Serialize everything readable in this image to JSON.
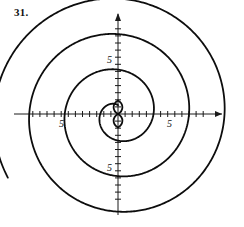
{
  "figure": {
    "problem_number": "31.",
    "background_color": "#ffffff",
    "ink_color": "#0d0d0d"
  },
  "axes": {
    "origin_px": [
      118,
      114
    ],
    "unit_px": 7.1,
    "x_label_left": "5",
    "x_label_right": "5",
    "y_label_top": "5",
    "y_label_bottom": "5",
    "x_tick_values": [
      -12,
      -11,
      -10,
      -9,
      -8,
      -7,
      -6,
      -5,
      -4,
      -3,
      -2,
      -1,
      1,
      2,
      3,
      4,
      5,
      6,
      7,
      8,
      9,
      10,
      11,
      12
    ],
    "y_tick_values": [
      -12,
      -11,
      -10,
      -9,
      -8,
      -7,
      -6,
      -5,
      -4,
      -3,
      -2,
      -1,
      1,
      2,
      3,
      4,
      5,
      6,
      7,
      8,
      9,
      10,
      11,
      12
    ],
    "x_arrow_right": true,
    "y_arrow_up": true,
    "x_axis_range": [
      -14.6,
      17.6
    ],
    "y_axis_range": [
      -14.2,
      14.2
    ]
  },
  "chart_data": {
    "type": "line",
    "title": "",
    "xlabel": "",
    "ylabel": "",
    "coordinate_system": "polar",
    "equation": "r = theta",
    "theta_range_rev": [
      0,
      3.35
    ],
    "theta_start_deg": 90,
    "radius_per_revolution_units": 5,
    "series": [
      {
        "name": "spiral",
        "a": 0.7957747,
        "theta_deg": [
          90,
          120,
          150,
          180,
          210,
          240,
          270,
          300,
          330,
          360,
          390,
          420,
          450,
          480,
          510,
          540,
          570,
          600,
          630,
          660,
          690,
          720,
          750,
          780,
          810,
          840,
          870,
          900,
          930,
          960,
          990,
          1020,
          1050,
          1080,
          1110,
          1140,
          1170,
          1200,
          1230,
          1260,
          1290
        ],
        "r_units": [
          1.25,
          1.67,
          2.08,
          2.5,
          2.92,
          3.33,
          3.75,
          4.17,
          4.58,
          5.0,
          5.42,
          5.83,
          6.25,
          6.67,
          7.08,
          7.5,
          7.92,
          8.33,
          8.75,
          9.17,
          9.58,
          10.0,
          10.42,
          10.83,
          11.25,
          11.67,
          12.08,
          12.5,
          12.92,
          13.33,
          13.75,
          14.17,
          14.58,
          15.0,
          15.42,
          15.83,
          16.25,
          16.67,
          17.08,
          17.5,
          17.92
        ]
      }
    ],
    "extra_loops": {
      "description": "two small lens/oval loops stacked vertically centered on the y-axis just above and below the origin",
      "upper_lens_center_units": [
        0,
        0.95
      ],
      "upper_lens_size_units": [
        1.25,
        1.9
      ],
      "lower_lens_center_units": [
        0,
        -0.95
      ],
      "lower_lens_size_units": [
        1.25,
        1.9
      ]
    },
    "axis_crossings": {
      "positive_x_units": [
        3.1,
        8.2,
        13.3
      ],
      "negative_x_units": [
        -5.6,
        -10.7
      ],
      "positive_y_units": [
        5.0,
        10.0
      ],
      "negative_y_units": [
        -5.0,
        -10.0,
        -13.8
      ]
    },
    "grid": false,
    "legend": null
  }
}
